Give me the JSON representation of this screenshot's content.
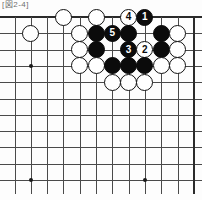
{
  "caption": {
    "text": "[図2-4]"
  },
  "board": {
    "type": "go-board-diagram",
    "columns": 12,
    "rows": 11,
    "origin_x": 14.5,
    "origin_y": 17,
    "spacing": 16.3,
    "line_color": "#4a4a4a",
    "edge_color": "#2b2b2b",
    "background_color": "#fdfdfd",
    "black_color": "#0b0b0b",
    "white_color": "#ffffff",
    "edges": {
      "top": true,
      "right": true,
      "left": false,
      "bottom": false
    },
    "hoshi": [
      {
        "col": 1,
        "row": 3
      },
      {
        "col": 1,
        "row": 10
      },
      {
        "col": 8,
        "row": 10
      }
    ],
    "stones": [
      {
        "col": 8,
        "row": 0,
        "color": "black",
        "label": "1"
      },
      {
        "col": 5,
        "row": 0,
        "color": "white",
        "label": ""
      },
      {
        "col": 3,
        "row": 0,
        "color": "white",
        "label": ""
      },
      {
        "col": 7,
        "row": 0,
        "color": "white",
        "label": "4"
      },
      {
        "col": 1,
        "row": 1,
        "color": "white",
        "label": ""
      },
      {
        "col": 4,
        "row": 1,
        "color": "white",
        "label": ""
      },
      {
        "col": 5,
        "row": 1,
        "color": "black",
        "label": ""
      },
      {
        "col": 6,
        "row": 1,
        "color": "black",
        "label": "5"
      },
      {
        "col": 7,
        "row": 1,
        "color": "black",
        "label": ""
      },
      {
        "col": 9,
        "row": 1,
        "color": "black",
        "label": ""
      },
      {
        "col": 10,
        "row": 1,
        "color": "white",
        "label": ""
      },
      {
        "col": 4,
        "row": 2,
        "color": "white",
        "label": ""
      },
      {
        "col": 5,
        "row": 2,
        "color": "black",
        "label": ""
      },
      {
        "col": 7,
        "row": 2,
        "color": "black",
        "label": "3"
      },
      {
        "col": 8,
        "row": 2,
        "color": "white",
        "label": "2"
      },
      {
        "col": 9,
        "row": 2,
        "color": "black",
        "label": ""
      },
      {
        "col": 10,
        "row": 2,
        "color": "white",
        "label": ""
      },
      {
        "col": 4,
        "row": 3,
        "color": "white",
        "label": ""
      },
      {
        "col": 5,
        "row": 3,
        "color": "white",
        "label": ""
      },
      {
        "col": 6,
        "row": 3,
        "color": "black",
        "label": ""
      },
      {
        "col": 7,
        "row": 3,
        "color": "black",
        "label": ""
      },
      {
        "col": 8,
        "row": 3,
        "color": "black",
        "label": ""
      },
      {
        "col": 9,
        "row": 3,
        "color": "white",
        "label": ""
      },
      {
        "col": 10,
        "row": 3,
        "color": "white",
        "label": ""
      },
      {
        "col": 6,
        "row": 4,
        "color": "white",
        "label": ""
      },
      {
        "col": 7,
        "row": 4,
        "color": "white",
        "label": ""
      },
      {
        "col": 8,
        "row": 4,
        "color": "white",
        "label": ""
      }
    ]
  }
}
